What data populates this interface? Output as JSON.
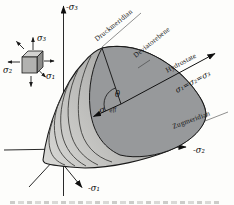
{
  "diagram": {
    "axis_labels": {
      "sigma3": "-σ₃",
      "sigma2": "-σ₂",
      "sigma1": "-σ₁"
    },
    "cube_labels": {
      "sigma3": "σ₃",
      "sigma2": "σ₂",
      "sigma1": "σ₁"
    },
    "annotations": {
      "druckmeridian": "Druckmeridian",
      "deviatorebene": "Deviatorebene",
      "hydrostate": "Hydrostate",
      "hydro_equation": "σ₁=σ₂=σ₃",
      "zugmeridian": "Zugmeridian",
      "lode_angle": "θ",
      "sigma_eff_base": "σ",
      "sigma_eff_sub": "eff"
    },
    "colors": {
      "background": "#fdfdfb",
      "outline": "#1a1a1a",
      "deviatoric_face": "#97999b",
      "body_light": "#d7d7d4",
      "body_dark": "#a3a3a1",
      "cube_top": "#d2d2d0",
      "cube_front": "#b2b2b0",
      "cube_side": "#8d8d8b"
    }
  }
}
